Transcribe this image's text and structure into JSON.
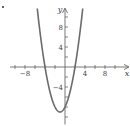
{
  "chart_data": {
    "type": "line",
    "title": "",
    "xlabel": "x",
    "ylabel": "y",
    "xlim": [
      -11,
      13
    ],
    "ylim": [
      -11.5,
      12
    ],
    "x_ticks": [
      -10,
      -8,
      -6,
      -4,
      -2,
      2,
      4,
      6,
      8,
      10
    ],
    "x_tick_labels": [
      {
        "value": -8,
        "label": "−8"
      },
      {
        "value": 4,
        "label": "4"
      },
      {
        "value": 8,
        "label": "8"
      }
    ],
    "y_ticks": [
      -10,
      -8,
      -6,
      -4,
      -2,
      2,
      4,
      6,
      8,
      10
    ],
    "y_tick_labels": [
      {
        "value": 8,
        "label": "8"
      },
      {
        "value": 4,
        "label": "4"
      },
      {
        "value": -4,
        "label": "−4"
      }
    ],
    "grid": false,
    "series": [
      {
        "name": "parabola",
        "function": "y = x^2 + 2x - 8",
        "roots": [
          -4,
          2
        ],
        "vertex": [
          -1,
          -9
        ],
        "color": "#6b6b6b"
      }
    ]
  },
  "colors": {
    "axis": "#555555",
    "curve": "#6b6b6b",
    "text": "#444444"
  }
}
